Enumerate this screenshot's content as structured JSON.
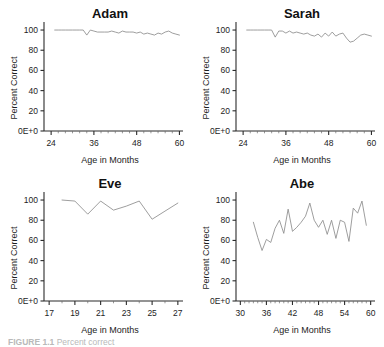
{
  "figure": {
    "caption_label": "FIGURE 1.1",
    "caption_text": "Percent correct",
    "panel_count": 4
  },
  "chart_data": [
    {
      "type": "line",
      "title": "Adam",
      "xlabel": "Age in Months",
      "ylabel": "Percent Correct",
      "xlim": [
        22,
        61
      ],
      "ylim": [
        0,
        104
      ],
      "xticks": [
        24,
        36,
        48,
        60
      ],
      "xtick_labels": [
        "24",
        "36",
        "48",
        "60"
      ],
      "yticks": [
        0,
        20,
        40,
        60,
        80,
        100
      ],
      "ytick_labels": [
        "0E+0",
        "20",
        "40",
        "60",
        "80",
        "100"
      ],
      "grid": false,
      "legend": "none",
      "line_color": "#8c8c8c",
      "x": [
        25,
        26,
        27,
        28,
        29,
        30,
        31,
        32,
        33,
        34,
        35,
        36,
        37,
        38,
        39,
        40,
        41,
        42,
        43,
        44,
        45,
        46,
        47,
        48,
        49,
        50,
        51,
        52,
        53,
        54,
        55,
        56,
        57,
        58,
        59,
        60
      ],
      "values": [
        100,
        100,
        100,
        100,
        100,
        100,
        100,
        100,
        100,
        95,
        100,
        99,
        98,
        98,
        98,
        98,
        99,
        98,
        97,
        99,
        98,
        98,
        98,
        97,
        98,
        96,
        97,
        96,
        95,
        97,
        96,
        98,
        99,
        97,
        96,
        95
      ]
    },
    {
      "type": "line",
      "title": "Sarah",
      "xlabel": "Age in Months",
      "ylabel": "Percent Correct",
      "xlim": [
        22,
        61
      ],
      "ylim": [
        0,
        104
      ],
      "xticks": [
        24,
        36,
        48,
        60
      ],
      "xtick_labels": [
        "24",
        "36",
        "48",
        "60"
      ],
      "yticks": [
        0,
        20,
        40,
        60,
        80,
        100
      ],
      "ytick_labels": [
        "0E+0",
        "20",
        "40",
        "60",
        "80",
        "100"
      ],
      "grid": false,
      "legend": "none",
      "line_color": "#8c8c8c",
      "x": [
        25,
        26,
        27,
        28,
        29,
        30,
        31,
        32,
        33,
        34,
        35,
        36,
        37,
        38,
        39,
        40,
        41,
        42,
        43,
        44,
        45,
        46,
        47,
        48,
        49,
        50,
        51,
        52,
        53,
        54,
        55,
        56,
        57,
        58,
        59,
        60
      ],
      "values": [
        100,
        100,
        100,
        100,
        100,
        100,
        100,
        100,
        93,
        99,
        99,
        97,
        99,
        97,
        98,
        97,
        96,
        97,
        95,
        94,
        96,
        93,
        97,
        94,
        98,
        94,
        96,
        97,
        92,
        88,
        89,
        92,
        95,
        96,
        95,
        94
      ]
    },
    {
      "type": "line",
      "title": "Eve",
      "xlabel": "Age in Months",
      "ylabel": "Percent Correct",
      "xlim": [
        16.6,
        27.4
      ],
      "ylim": [
        0,
        104
      ],
      "xticks": [
        17,
        19,
        21,
        23,
        25,
        27
      ],
      "xtick_labels": [
        "17",
        "19",
        "21",
        "23",
        "25",
        "27"
      ],
      "yticks": [
        0,
        20,
        40,
        60,
        80,
        100
      ],
      "ytick_labels": [
        "0E+0",
        "20",
        "40",
        "60",
        "80",
        "100"
      ],
      "grid": false,
      "legend": "none",
      "line_color": "#8c8c8c",
      "x": [
        18,
        19,
        20,
        21,
        22,
        23,
        24,
        25,
        26,
        27
      ],
      "values": [
        100,
        99,
        86,
        99,
        90,
        94,
        99,
        81,
        89,
        97
      ]
    },
    {
      "type": "line",
      "title": "Abe",
      "xlabel": "Age in Months",
      "ylabel": "Percent Correct",
      "xlim": [
        29,
        61
      ],
      "ylim": [
        0,
        104
      ],
      "xticks": [
        30,
        36,
        42,
        48,
        54,
        60
      ],
      "xtick_labels": [
        "30",
        "36",
        "42",
        "48",
        "54",
        "60"
      ],
      "yticks": [
        0,
        20,
        40,
        60,
        80,
        100
      ],
      "ytick_labels": [
        "0E+0",
        "20",
        "40",
        "60",
        "80",
        "100"
      ],
      "grid": false,
      "legend": "none",
      "line_color": "#8c8c8c",
      "x": [
        33,
        34,
        35,
        36,
        37,
        38,
        39,
        40,
        41,
        42,
        43,
        44,
        45,
        46,
        47,
        48,
        49,
        50,
        51,
        52,
        53,
        54,
        55,
        56,
        57,
        58,
        59
      ],
      "values": [
        78,
        63,
        50,
        61,
        58,
        72,
        80,
        67,
        91,
        69,
        73,
        78,
        84,
        97,
        80,
        73,
        80,
        66,
        80,
        62,
        80,
        78,
        59,
        92,
        87,
        99,
        75
      ]
    }
  ]
}
